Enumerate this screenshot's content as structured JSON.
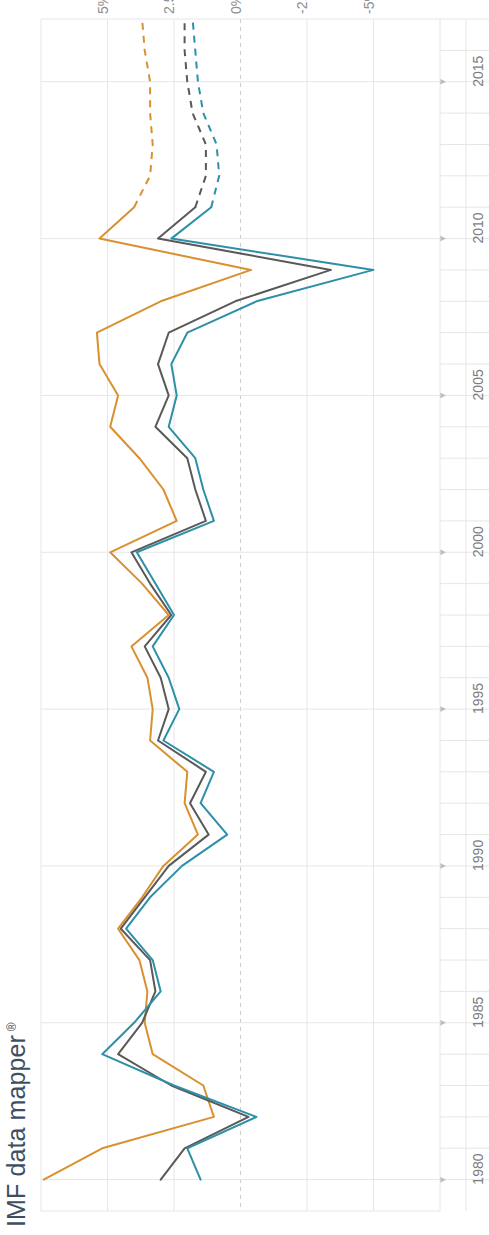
{
  "title": {
    "text": "IMF data mapper",
    "trademark": "®",
    "color": "#3d4f63"
  },
  "chart_data": {
    "type": "line",
    "title": "",
    "orientation": "rotated-90",
    "xlabel": "",
    "ylabel": "",
    "grid": true,
    "legend": "none",
    "value_axis": {
      "position": "top",
      "tick_labels": [
        "5%",
        "2.5%",
        "0%",
        "-2.5%",
        "-5%"
      ],
      "tick_values": [
        5,
        2.5,
        0,
        -2.5,
        -5
      ],
      "range": [
        7.5,
        -7.5
      ],
      "zero_line_dashed": true
    },
    "time_axis": {
      "position": "right",
      "tick_labels": [
        "2015",
        "2010",
        "2005",
        "2000",
        "1995",
        "1990",
        "1985",
        "1980"
      ],
      "tick_values": [
        2015,
        2010,
        2005,
        2000,
        1995,
        1990,
        1985,
        1980
      ],
      "range": [
        2017,
        1979
      ],
      "minor_tick_step": 1
    },
    "forecast_starts_at": 2011,
    "series": [
      {
        "name": "series-orange",
        "color": "#d9902f",
        "x": [
          1980,
          1981,
          1982,
          1983,
          1984,
          1985,
          1986,
          1987,
          1988,
          1989,
          1990,
          1991,
          1992,
          1993,
          1994,
          1995,
          1996,
          1997,
          1998,
          1999,
          2000,
          2001,
          2002,
          2003,
          2004,
          2005,
          2006,
          2007,
          2008,
          2009,
          2010,
          2011,
          2012,
          2013,
          2014,
          2015,
          2016,
          2017
        ],
        "values": [
          7.4,
          5.2,
          1.0,
          1.4,
          3.3,
          3.6,
          3.5,
          3.8,
          4.6,
          3.7,
          2.9,
          1.6,
          2.1,
          2.0,
          3.4,
          3.3,
          3.5,
          4.1,
          2.7,
          3.7,
          4.9,
          2.4,
          2.9,
          3.8,
          4.9,
          4.6,
          5.3,
          5.4,
          3.0,
          -0.4,
          5.3,
          4.0,
          3.4,
          3.3,
          3.4,
          3.4,
          3.6,
          3.7
        ],
        "dash_from": 2011
      },
      {
        "name": "series-gray",
        "color": "#595959",
        "x": [
          1980,
          1981,
          1982,
          1983,
          1984,
          1985,
          1986,
          1987,
          1988,
          1989,
          1990,
          1991,
          1992,
          1993,
          1994,
          1995,
          1996,
          1997,
          1998,
          1999,
          2000,
          2001,
          2002,
          2003,
          2004,
          2005,
          2006,
          2007,
          2008,
          2009,
          2010,
          2011,
          2012,
          2013,
          2014,
          2015,
          2016,
          2017
        ],
        "values": [
          3.0,
          2.1,
          -0.3,
          2.6,
          4.6,
          3.7,
          3.2,
          3.4,
          4.5,
          3.6,
          2.7,
          1.2,
          1.9,
          1.3,
          3.1,
          2.7,
          3.0,
          3.6,
          2.6,
          3.4,
          4.1,
          1.3,
          1.7,
          2.0,
          3.2,
          2.7,
          3.1,
          2.7,
          0.2,
          -3.4,
          3.1,
          1.7,
          1.3,
          1.3,
          1.8,
          2.0,
          2.1,
          2.1
        ],
        "dash_from": 2011
      },
      {
        "name": "series-teal",
        "color": "#2d8fa8",
        "x": [
          1980,
          1981,
          1982,
          1983,
          1984,
          1985,
          1986,
          1987,
          1988,
          1989,
          1990,
          1991,
          1992,
          1993,
          1994,
          1995,
          1996,
          1997,
          1998,
          1999,
          2000,
          2001,
          2002,
          2003,
          2004,
          2005,
          2006,
          2007,
          2008,
          2009,
          2010,
          2011,
          2012,
          2013,
          2014,
          2015,
          2016,
          2017
        ],
        "values": [
          1.5,
          2.0,
          -0.6,
          2.5,
          5.2,
          4.0,
          3.0,
          3.3,
          4.3,
          3.4,
          2.2,
          0.5,
          1.5,
          1.0,
          2.9,
          2.3,
          2.7,
          3.3,
          2.5,
          3.2,
          3.9,
          1.0,
          1.4,
          1.7,
          2.7,
          2.4,
          2.6,
          2.0,
          -0.6,
          -5.0,
          2.6,
          1.1,
          0.8,
          0.9,
          1.4,
          1.6,
          1.7,
          1.8
        ],
        "dash_from": 2011
      }
    ]
  },
  "axes": {
    "grid_color": "#e6e6e6",
    "zero_line_color": "#cccccc",
    "axis_line_color": "#b3b3b3",
    "tick_text_color": "#7d7d7d"
  }
}
